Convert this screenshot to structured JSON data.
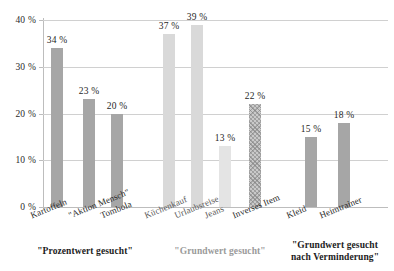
{
  "chart_data": {
    "type": "bar",
    "title": "",
    "xlabel": "",
    "ylabel": "",
    "ylim": [
      0,
      40
    ],
    "grid": true,
    "legend": "none",
    "ytick_labels": [
      "0 %",
      "10 %",
      "20 %",
      "30 %",
      "40 %"
    ],
    "ytick_values": [
      0,
      10,
      20,
      30,
      40
    ],
    "categories": [
      "Kartoffeln",
      "\"Aktion Mensch\"",
      "Tombola",
      "Küchenkauf",
      "Urlaubsreise",
      "Jeans",
      "Inverses Item",
      "Kleid",
      "Heimtrainer"
    ],
    "values": [
      34,
      23,
      20,
      37,
      39,
      13,
      22,
      15,
      18
    ],
    "value_labels": [
      "34 %",
      "23 %",
      "20 %",
      "37 %",
      "39 %",
      "13 %",
      "22 %",
      "15 %",
      "18 %"
    ],
    "bar_styles": [
      "solid-mid",
      "solid-mid",
      "solid-mid",
      "solid-light",
      "solid-light",
      "solid-xlight",
      "hatch",
      "solid-mid",
      "solid-mid"
    ],
    "groups": [
      {
        "caption": "\"Prozentwert gesucht\"",
        "tone": "dark",
        "category_indices": [
          0,
          1,
          2
        ]
      },
      {
        "caption": "\"Grundwert gesucht\"",
        "tone": "gray",
        "category_indices": [
          3,
          4,
          5,
          6
        ]
      },
      {
        "caption": "\"Grundwert gesucht\nnach Verminderung\"",
        "tone": "dark",
        "category_indices": [
          7,
          8
        ]
      }
    ],
    "colors": {
      "bar_mid": "#a6a6a6",
      "bar_light": "#d9d9d9",
      "bar_xlight": "#e4e4e4",
      "bar_hatch": "#c9c9c9",
      "grid": "#d0d0d0",
      "axis": "#bdbdbd",
      "text": "#222222",
      "text_muted": "#9a9a9a"
    }
  }
}
